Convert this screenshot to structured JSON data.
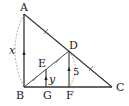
{
  "diagram": {
    "points": {
      "A": {
        "label": "A",
        "x": 24,
        "y": 14
      },
      "B": {
        "label": "B",
        "x": 24,
        "y": 87
      },
      "C": {
        "label": "C",
        "x": 112,
        "y": 87
      },
      "D": {
        "label": "D",
        "x": 69,
        "y": 51
      },
      "E": {
        "label": "E",
        "x": 46,
        "y": 69
      },
      "F": {
        "label": "F",
        "x": 69,
        "y": 87
      },
      "G": {
        "label": "G",
        "x": 46,
        "y": 87
      }
    },
    "labels": {
      "x": "x",
      "y": "y",
      "five": "5"
    },
    "colors": {
      "line": "#333333",
      "dashed": "#999999"
    }
  }
}
